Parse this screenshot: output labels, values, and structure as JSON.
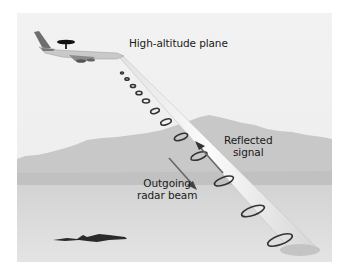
{
  "diagram": {
    "labels": {
      "plane": "High-altitude plane",
      "reflected_line1": "Reflected",
      "reflected_line2": "signal",
      "outgoing_line1": "Outgoing",
      "outgoing_line2": "radar beam"
    },
    "elements": [
      "plane-with-radar-dome",
      "radar-beam-cone",
      "beam-rings",
      "reflected-signal-arrow",
      "outgoing-beam-arrow",
      "mountains",
      "desert-floor",
      "ground-object-shadow"
    ],
    "colors": {
      "sky": "#f0f0f0",
      "mountains": "#c9c9c9",
      "ground": "#dcdcdc",
      "beam": "#f7f7f7",
      "ring": "#3a3a3a",
      "arrow": "#6a6a6a",
      "text": "#1a1a1a"
    }
  }
}
